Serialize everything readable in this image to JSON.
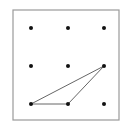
{
  "diagram": {
    "frame": {
      "x": 13,
      "y": 10,
      "width": 106,
      "height": 110,
      "stroke": "#9a9a9a"
    },
    "dot_color": "#111111",
    "line_color": "#666666",
    "dots": [
      {
        "id": "r1c1",
        "x": 31,
        "y": 28
      },
      {
        "id": "r1c2",
        "x": 68,
        "y": 28
      },
      {
        "id": "r1c3",
        "x": 104,
        "y": 28
      },
      {
        "id": "r2c1",
        "x": 31,
        "y": 66
      },
      {
        "id": "r2c2",
        "x": 68,
        "y": 66
      },
      {
        "id": "r2c3",
        "x": 104,
        "y": 66
      },
      {
        "id": "r3c1",
        "x": 31,
        "y": 104
      },
      {
        "id": "r3c2",
        "x": 68,
        "y": 104
      },
      {
        "id": "r3c3",
        "x": 104,
        "y": 104
      }
    ],
    "triangle": {
      "vertices": [
        "r3c1",
        "r3c2",
        "r2c3"
      ],
      "points": "31,104 68,104 104,66"
    }
  }
}
